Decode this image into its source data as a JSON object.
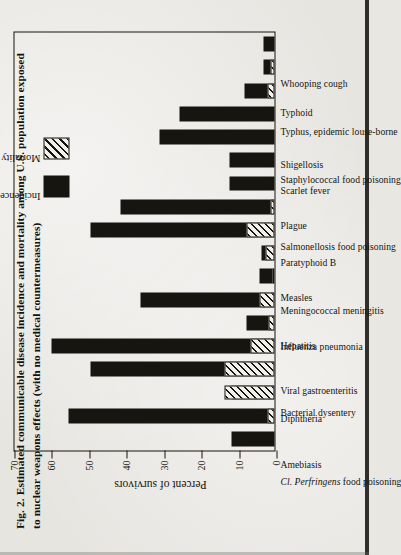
{
  "figure": {
    "caption_lines": [
      "Fig. 2.  Estimated communicable disease incidence and mortality among U.S. population exposed",
      "to nuclear weapons effects (with no medical countermeasures)"
    ]
  },
  "legend": {
    "incidence_label": "Incidence",
    "mortality_label": "Mortality"
  },
  "colors": {
    "ink": "#16150f",
    "paper": "#e7e5e0",
    "incidence_fill": "#16150f",
    "mortality_fill": "#f2f0ea"
  },
  "chart_data": {
    "type": "bar",
    "title": "Fig. 2.  Estimated communicable disease incidence and mortality among U.S. population exposed to nuclear weapons effects (with no medical countermeasures)",
    "orientation": "vertical-on-rotated-page",
    "xlabel": "",
    "ylabel": "Percent of survivors",
    "ylim": [
      0,
      70
    ],
    "yticks": [
      0,
      10,
      20,
      30,
      40,
      50,
      60,
      70
    ],
    "grid": false,
    "legend_position": "inside-upper-right",
    "categories": [
      "Amebiasis",
      "Cl. Perfringens food poisoning",
      "Diphtheria",
      "Bacterial dysentery",
      "Viral gastroenteritis",
      "Hepatitis",
      "Influenza pneumonia",
      "Measles",
      "Meningococcal meningitis",
      "Paratyphoid B",
      "Plague",
      "Salmonellosis food poisoning",
      "Scarlet fever",
      "Shigellosis",
      "Staphylococcal food poisoning",
      "Typhoid",
      "Typhus, epidemic louse-borne",
      "Whooping cough"
    ],
    "series": [
      {
        "name": "Incidence",
        "values": [
          11.5,
          55.5,
          11.5,
          49.5,
          60.0,
          7.5,
          36.0,
          4.0,
          3.5,
          49.5,
          41.5,
          12.0,
          12.0,
          31.0,
          25.5,
          8.0,
          3.0,
          3.0
        ]
      },
      {
        "name": "Mortality",
        "values": [
          0.0,
          2.0,
          13.5,
          13.5,
          6.5,
          1.5,
          4.0,
          0.5,
          2.5,
          7.5,
          1.0,
          0.0,
          0.0,
          0.0,
          0.0,
          2.0,
          1.0,
          0.0
        ]
      }
    ]
  }
}
